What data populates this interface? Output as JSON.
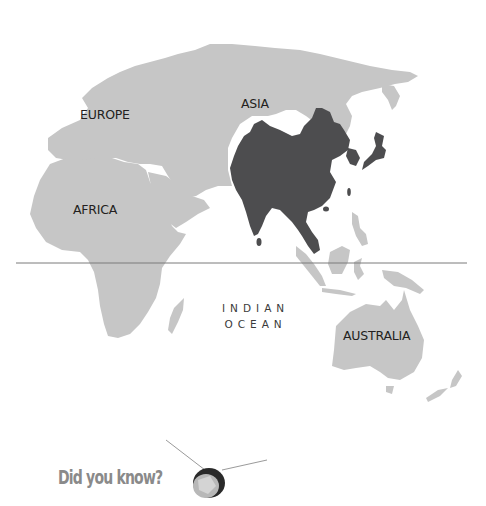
{
  "map": {
    "colors": {
      "land": "#c6c6c6",
      "highlight": "#4d4d4f",
      "equator": "#7a7a7a",
      "label": "#231f20",
      "callout": "#8a8a8a"
    },
    "highlighted_region": "East, South and Southeast Asia",
    "labels": {
      "europe": "EUROPE",
      "asia": "ASIA",
      "africa": "AFRICA",
      "australia": "AUSTRALIA",
      "ocean_line1": "INDIAN",
      "ocean_line2": "OCEAN"
    },
    "equator_line": true
  },
  "callout": {
    "text": "Did you know?",
    "icon": "satellite-icon"
  }
}
